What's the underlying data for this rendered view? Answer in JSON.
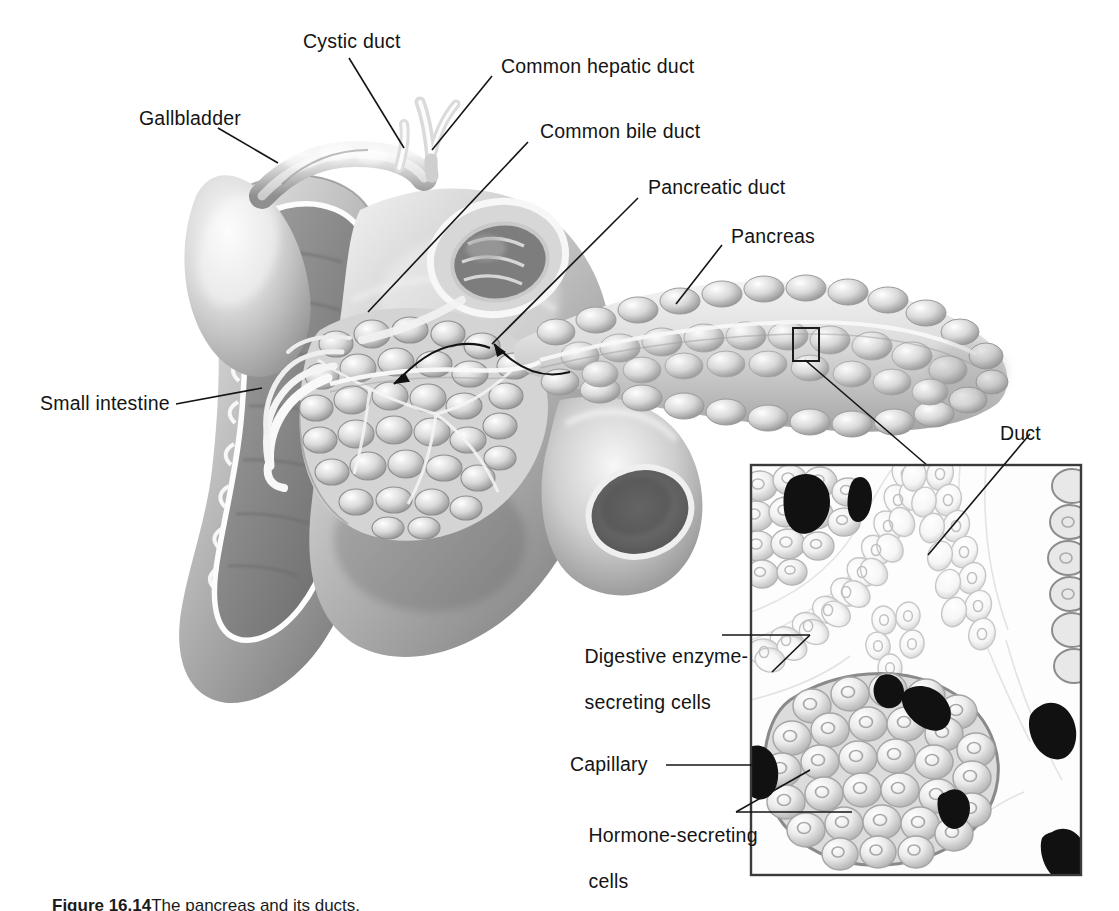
{
  "figure": {
    "title": "The pancreas",
    "caption_prefix": "Figure 16.14",
    "caption_text": "The pancreas and its ducts.",
    "background_color": "#ffffff",
    "ink_color": "#141414"
  },
  "labels": {
    "cystic_duct": "Cystic duct",
    "gallbladder": "Gallbladder",
    "common_hepatic_duct": "Common hepatic duct",
    "common_bile_duct": "Common bile duct",
    "pancreatic_duct": "Pancreatic duct",
    "pancreas": "Pancreas",
    "small_intestine": "Small intestine",
    "duct": "Duct",
    "digestive_enzyme_cells_line1": "Digestive enzyme-",
    "digestive_enzyme_cells_line2": "secreting cells",
    "capillary": "Capillary",
    "hormone_cells_line1": "Hormone-secreting",
    "hormone_cells_line2": "cells"
  },
  "structures": {
    "main_illustration": "grayscale airbrush drawing of gallbladder, duodenum, pancreas with ducts",
    "inset": {
      "name": "pancreatic tissue micrograph inset",
      "contents": [
        "duct lined with epithelial cells",
        "acinar digestive enzyme-secreting cells",
        "islet of hormone-secreting cells",
        "dark capillaries"
      ],
      "border_color": "#3a3a3a"
    },
    "magnifier_box": "small rectangle on pancreas tail linking to inset"
  },
  "colors": {
    "tissue_light": "#f2f2f2",
    "tissue_mid": "#c9c9c9",
    "tissue_dark": "#8d8d8d",
    "tissue_shadow": "#5e5e5e",
    "capillary": "#1a1a1a",
    "leader_line": "#141414"
  }
}
